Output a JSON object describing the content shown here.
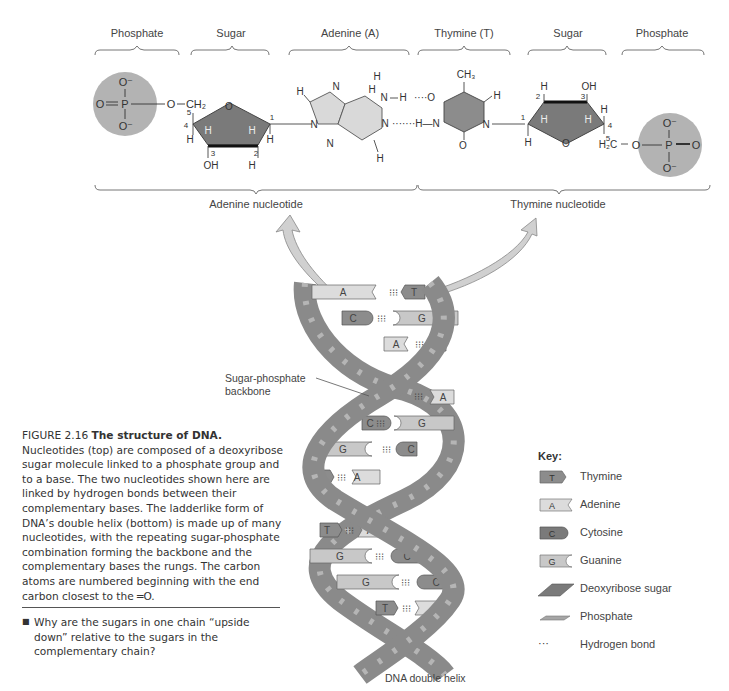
{
  "top_labels": {
    "phosphate_left": "Phosphate",
    "sugar_left": "Sugar",
    "adenine": "Adenine (A)",
    "thymine": "Thymine (T)",
    "sugar_right": "Sugar",
    "phosphate_right": "Phosphate"
  },
  "bottom_labels": {
    "adenine_nucleotide": "Adenine nucleotide",
    "thymine_nucleotide": "Thymine nucleotide"
  },
  "molecule_text": {
    "o_minus": "O⁻",
    "o": "O",
    "p": "P",
    "h": "H",
    "n": "N",
    "oh": "OH",
    "ch2": "CH₂",
    "h2c": "H₂C",
    "ch3": "CH₃",
    "c_numbers": [
      "1",
      "2",
      "3",
      "4",
      "5"
    ]
  },
  "helix": {
    "backbone_label_line1": "Sugar-phosphate",
    "backbone_label_line2": "backbone",
    "caption": "DNA double helix",
    "rungs": [
      {
        "left": "A",
        "right": "T"
      },
      {
        "left": "C",
        "right": "G"
      },
      {
        "left": "A",
        "right": "T"
      },
      {
        "left": "",
        "right": "A"
      },
      {
        "left": "C",
        "right": "G"
      },
      {
        "left": "G",
        "right": "C"
      },
      {
        "left": "T",
        "right": "A"
      },
      {
        "left": "T",
        "right": "A"
      },
      {
        "left": "G",
        "right": "C"
      },
      {
        "left": "G",
        "right": "C"
      },
      {
        "left": "T",
        "right": "A"
      }
    ]
  },
  "caption": {
    "figure_number": "FIGURE 2.16",
    "title": "The structure of DNA.",
    "body": "Nucleotides (top) are composed of a deoxyribose sugar molecule linked to a phosphate group and to a base. The two nucleotides shown here are linked by hydrogen bonds between their complementary bases. The ladderlike form of DNA’s double helix (bottom) is made up of many nucleotides, with the repeating sugar-phosphate combination forming the backbone and the complementary bases the rungs. The carbon atoms are numbered beginning with the end carbon closest to the ═O."
  },
  "question": {
    "bullet": "■",
    "text": "Why are the sugars in one chain “upside down” relative to the sugars in the complementary chain?"
  },
  "key": {
    "title": "Key:",
    "items": [
      {
        "symbol": "T",
        "label": "Thymine"
      },
      {
        "symbol": "A",
        "label": "Adenine"
      },
      {
        "symbol": "C",
        "label": "Cytosine"
      },
      {
        "symbol": "G",
        "label": "Guanine"
      },
      {
        "symbol": "",
        "label": "Deoxyribose sugar"
      },
      {
        "symbol": "",
        "label": "Phosphate"
      },
      {
        "symbol": "···",
        "label": "Hydrogen bond"
      }
    ]
  },
  "colors": {
    "dark_gray": "#8a8a8a",
    "medium_gray": "#a6a6a6",
    "light_gray": "#d6d6d6",
    "phosphate_circle": "#b3b3b3",
    "text": "#444444"
  }
}
